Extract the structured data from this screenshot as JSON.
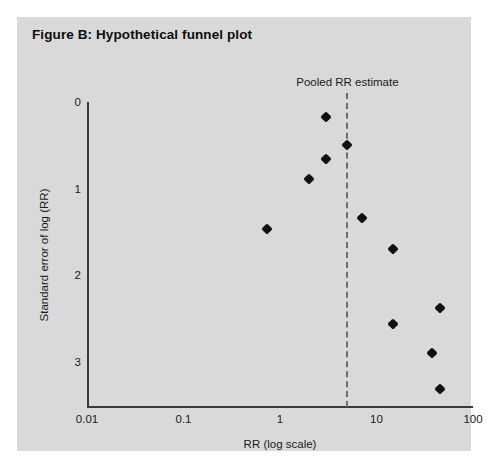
{
  "figure": {
    "title": "Figure B: Hypothetical funnel plot",
    "panel_background": "#d9d9d9",
    "page_background": "#ffffff"
  },
  "annotation": {
    "pooled_label": "Pooled RR estimate",
    "pooled_rr_value": 5,
    "line_color": "#6d6d6d",
    "line_style": "dashed"
  },
  "axes": {
    "x": {
      "title": "RR (log scale)",
      "scale": "log10",
      "ticks": [
        "0.01",
        "0.1",
        "1",
        "10",
        "100"
      ],
      "tick_values": [
        0.01,
        0.1,
        1,
        10,
        100
      ],
      "range": [
        0.01,
        100
      ]
    },
    "y": {
      "title": "Standard error of log (RR)",
      "scale": "linear",
      "inverted": true,
      "ticks": [
        "0",
        "1",
        "2",
        "3"
      ],
      "tick_values": [
        0,
        1,
        2,
        3
      ],
      "range": [
        0,
        3.5
      ]
    }
  },
  "chart_data": {
    "type": "scatter",
    "title": "Figure B: Hypothetical funnel plot",
    "subtitle": "",
    "xlabel": "RR (log scale)",
    "ylabel": "Standard error of log (RR)",
    "xscale": "log",
    "xlim": [
      0.01,
      100
    ],
    "ylim": [
      0,
      3.5
    ],
    "y_inverted": true,
    "grid": false,
    "legend": false,
    "marker": "diamond",
    "marker_color": "#111111",
    "annotations": [
      {
        "text": "Pooled RR estimate",
        "type": "vline",
        "x": 5,
        "style": "dashed",
        "color": "#6d6d6d"
      }
    ],
    "series": [
      {
        "name": "Studies",
        "points": [
          {
            "x": 3.0,
            "y": 0.17
          },
          {
            "x": 5.0,
            "y": 0.5
          },
          {
            "x": 3.0,
            "y": 0.66
          },
          {
            "x": 2.0,
            "y": 0.89
          },
          {
            "x": 0.73,
            "y": 1.47
          },
          {
            "x": 7.0,
            "y": 1.34
          },
          {
            "x": 15.0,
            "y": 1.7
          },
          {
            "x": 45.0,
            "y": 2.38
          },
          {
            "x": 15.0,
            "y": 2.57
          },
          {
            "x": 38.0,
            "y": 2.9
          },
          {
            "x": 45.0,
            "y": 3.32
          }
        ]
      }
    ]
  }
}
